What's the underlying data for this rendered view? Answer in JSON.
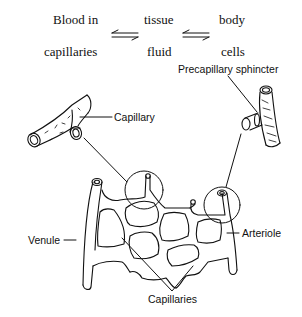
{
  "equation": {
    "terms": [
      {
        "line1": "Blood in",
        "line2": "capillaries"
      },
      {
        "line1": "tissue",
        "line2": "fluid"
      },
      {
        "line1": "body",
        "line2": "cells"
      }
    ],
    "arrows": [
      "equilibrium-arrows",
      "equilibrium-arrows"
    ]
  },
  "labels": {
    "capillary": "Capillary",
    "precapillary_sphincter": "Precapillary sphincter",
    "venule": "Venule",
    "arteriole": "Arteriole",
    "capillaries": "Capillaries"
  },
  "colors": {
    "ink": "#111111",
    "background": "#ffffff"
  }
}
